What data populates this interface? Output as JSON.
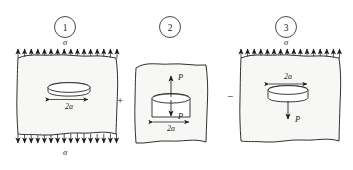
{
  "figure": {
    "caption_numbers": [
      "1",
      "2",
      "3"
    ],
    "operators": [
      "+",
      "−"
    ],
    "panels": [
      {
        "id": "panel-1",
        "number": "1",
        "top_stress_label": "σ",
        "bottom_stress_label": "σ",
        "crack_label": "2a",
        "arrow_count_top": 16,
        "arrow_count_bottom": 16,
        "description": "cracked body under remote tension sigma"
      },
      {
        "id": "panel-2",
        "number": "2",
        "force_up_label": "P",
        "force_down_label": "P",
        "crack_label": "2a",
        "description": "crack faces loaded by opposing point forces P"
      },
      {
        "id": "panel-3",
        "number": "3",
        "top_stress_label": "σ",
        "force_down_label": "P",
        "crack_label": "2a",
        "arrow_count_top": 16,
        "description": "remote tension sigma with downward force P on crack"
      }
    ]
  },
  "colors": {
    "ink": "#1a1a1a",
    "body_fill": "#f7f7f5",
    "crack_fill": "#ffffff",
    "background": "#ffffff"
  }
}
